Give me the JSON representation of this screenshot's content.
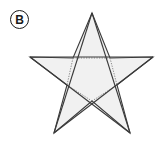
{
  "figure": {
    "label": "B",
    "label_style": "circled-letter",
    "background_color": "#ffffff",
    "shape": {
      "name": "five-pointed-star",
      "kind": "pentagram",
      "fill_color": "#f1f1f1",
      "stroke_color": "#3a3a3a",
      "stroke_width": 1.1,
      "dotted_stroke_color": "#8a8a8a",
      "dotted_stroke_width": 1.0,
      "outer_points": [
        {
          "name": "top",
          "x": 92,
          "y": 13
        },
        {
          "name": "right",
          "x": 153,
          "y": 57
        },
        {
          "name": "bottom-right",
          "x": 130,
          "y": 133
        },
        {
          "name": "bottom-left",
          "x": 54,
          "y": 133
        },
        {
          "name": "left",
          "x": 30,
          "y": 57
        }
      ],
      "inner_points": [
        {
          "name": "upper-right",
          "x": 110,
          "y": 58
        },
        {
          "name": "lower-right",
          "x": 117,
          "y": 85
        },
        {
          "name": "bottom",
          "x": 92,
          "y": 101
        },
        {
          "name": "lower-left",
          "x": 67,
          "y": 85
        },
        {
          "name": "upper-left",
          "x": 73,
          "y": 58
        }
      ],
      "dotted_edges": [
        {
          "from": "upper-left",
          "to": "upper-right",
          "style": "dotted"
        },
        {
          "from": "upper-right",
          "to": "lower-right",
          "style": "dotted"
        },
        {
          "from": "upper-left",
          "to": "lower-left",
          "style": "dotted"
        },
        {
          "from": "lower-left",
          "to": "bottom",
          "style": "dotted"
        },
        {
          "from": "lower-right",
          "to": "bottom",
          "style": "dotted"
        }
      ]
    }
  }
}
